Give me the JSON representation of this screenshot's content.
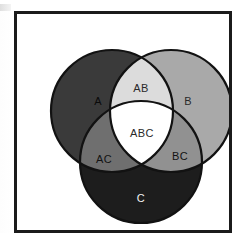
{
  "figure": {
    "type": "venn-diagram",
    "sets_count": 3,
    "frame_border_color": "#1b1b1b",
    "background_color": "#ffffff"
  },
  "regions": [
    {
      "key": "a_only",
      "label": "A",
      "fill": "#3a3a3a",
      "text_color": "#0a0a0a",
      "cx": 81,
      "cy": 88
    },
    {
      "key": "b_only",
      "label": "B",
      "fill": "#a9a9a9",
      "text_color": "#2a2a2a",
      "cx": 171,
      "cy": 88
    },
    {
      "key": "c_only",
      "label": "C",
      "fill": "#1d1d1d",
      "text_color": "#f2f2f2",
      "cx": 124,
      "cy": 185
    },
    {
      "key": "ab",
      "label": "AB",
      "fill": "#dcdcdc",
      "text_color": "#2a2a2a",
      "cx": 124,
      "cy": 75
    },
    {
      "key": "ac",
      "label": "AC",
      "fill": "#6f6f6f",
      "text_color": "#131313",
      "cx": 87,
      "cy": 146
    },
    {
      "key": "bc",
      "label": "BC",
      "fill": "#919191",
      "text_color": "#131313",
      "cx": 163,
      "cy": 143
    },
    {
      "key": "abc",
      "label": "ABC",
      "fill": "#ffffff",
      "text_color": "#2a2a2a",
      "cx": 125,
      "cy": 120
    }
  ],
  "circles": {
    "stroke_color": "#121212",
    "stroke_width": 2.2,
    "a": {
      "cx": 95,
      "cy": 97,
      "r": 61
    },
    "b": {
      "cx": 154,
      "cy": 97,
      "r": 61
    },
    "c": {
      "cx": 124,
      "cy": 148,
      "r": 61
    }
  }
}
